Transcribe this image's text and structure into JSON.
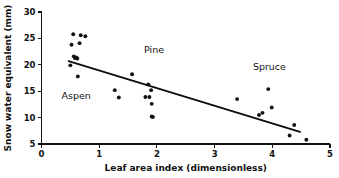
{
  "chart_data": {
    "type": "scatter",
    "title": "",
    "xlabel": "Leaf area index (dimensionless)",
    "ylabel": "Snow water equivalent (mm)",
    "xlim": [
      0,
      5
    ],
    "ylim": [
      5,
      30
    ],
    "xticks": [
      0,
      1,
      2,
      3,
      4,
      5
    ],
    "xtick_labels": [
      "0",
      "1",
      "2",
      "3",
      "4",
      "5"
    ],
    "yticks": [
      5,
      10,
      15,
      20,
      25,
      30
    ],
    "ytick_labels": [
      "5",
      "10",
      "15",
      "20",
      "25",
      "30"
    ],
    "grid": false,
    "legend": "none",
    "marker": "filled-circle",
    "marker_color": "#131313",
    "points": [
      {
        "x": 0.5,
        "y": 19.9
      },
      {
        "x": 0.52,
        "y": 23.8
      },
      {
        "x": 0.55,
        "y": 25.8
      },
      {
        "x": 0.56,
        "y": 21.6
      },
      {
        "x": 0.58,
        "y": 21.3
      },
      {
        "x": 0.6,
        "y": 21.4
      },
      {
        "x": 0.62,
        "y": 21.2
      },
      {
        "x": 0.63,
        "y": 17.8
      },
      {
        "x": 0.66,
        "y": 24.1
      },
      {
        "x": 0.68,
        "y": 25.6
      },
      {
        "x": 0.76,
        "y": 25.4
      },
      {
        "x": 1.27,
        "y": 15.2
      },
      {
        "x": 1.34,
        "y": 13.8
      },
      {
        "x": 1.57,
        "y": 18.2
      },
      {
        "x": 1.8,
        "y": 13.9
      },
      {
        "x": 1.85,
        "y": 16.3
      },
      {
        "x": 1.87,
        "y": 13.9
      },
      {
        "x": 1.9,
        "y": 15.2
      },
      {
        "x": 1.91,
        "y": 12.6
      },
      {
        "x": 1.91,
        "y": 10.2
      },
      {
        "x": 1.93,
        "y": 10.1
      },
      {
        "x": 3.39,
        "y": 13.5
      },
      {
        "x": 3.77,
        "y": 10.5
      },
      {
        "x": 3.83,
        "y": 10.9
      },
      {
        "x": 3.93,
        "y": 15.4
      },
      {
        "x": 3.99,
        "y": 11.9
      },
      {
        "x": 4.3,
        "y": 6.6
      },
      {
        "x": 4.38,
        "y": 8.6
      },
      {
        "x": 4.59,
        "y": 5.8
      }
    ],
    "trend_line": {
      "x_start": 0.47,
      "y_start": 20.7,
      "x_end": 4.48,
      "y_end": 7.3
    },
    "annotations": [
      {
        "text": "Aspen",
        "x": 0.6,
        "y": 13.6
      },
      {
        "text": "Pine",
        "x": 1.95,
        "y": 22.2
      },
      {
        "text": "Spruce",
        "x": 3.95,
        "y": 19.1
      }
    ]
  }
}
